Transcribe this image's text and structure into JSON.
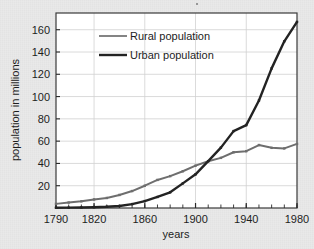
{
  "figure": {
    "background_color": "#e9e9e9",
    "plot_background_color": "#ffffff",
    "border_color": "#3a3a3a"
  },
  "chart_data": {
    "type": "line",
    "title": "",
    "xlabel": "years",
    "ylabel": "population in millions",
    "xlim": [
      1790,
      1980
    ],
    "ylim": [
      0,
      175
    ],
    "xticks": [
      1790,
      1820,
      1860,
      1900,
      1940,
      1980
    ],
    "xtick_labels": [
      "1790",
      "1820",
      "1860",
      "1900",
      "1940",
      "1980"
    ],
    "xminor_step": 10,
    "yticks": [
      20,
      40,
      60,
      80,
      100,
      120,
      140,
      160
    ],
    "ytick_labels": [
      "20",
      "40",
      "60",
      "80",
      "100",
      "120",
      "140",
      "160"
    ],
    "grid": true,
    "grid_color": "#d0d0d0",
    "legend_position": "upper-left-inside",
    "x": [
      1790,
      1800,
      1810,
      1820,
      1830,
      1840,
      1850,
      1860,
      1870,
      1880,
      1890,
      1900,
      1910,
      1920,
      1930,
      1940,
      1950,
      1960,
      1970,
      1980
    ],
    "series": [
      {
        "name": "Rural population",
        "color": "#6e6e6e",
        "line_width": 2,
        "values": [
          3.7,
          4.9,
          6.0,
          7.7,
          9.0,
          11.7,
          15.2,
          20.0,
          25.2,
          28.6,
          33.0,
          38.0,
          42.0,
          45.0,
          50.0,
          51.0,
          56.5,
          54.0,
          53.5,
          57.5
        ]
      },
      {
        "name": "Urban population",
        "color": "#232323",
        "line_width": 2.4,
        "values": [
          0.2,
          0.3,
          0.5,
          0.7,
          1.1,
          1.8,
          3.5,
          6.2,
          9.9,
          14.1,
          22.1,
          30.2,
          42.0,
          54.2,
          69.0,
          74.4,
          96.5,
          125.3,
          149.6,
          167.0
        ]
      }
    ],
    "legend": [
      {
        "label": "Rural population",
        "color": "#6e6e6e"
      },
      {
        "label": "Urban population",
        "color": "#232323"
      }
    ]
  }
}
